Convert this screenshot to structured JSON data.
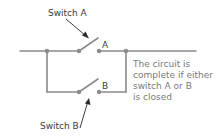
{
  "diagram": {
    "type": "parallel-switch-circuit",
    "labels": {
      "switch_a_callout": "Switch A",
      "switch_b_callout": "Switch B",
      "contact_a": "A",
      "contact_b": "B"
    },
    "note": {
      "lines": [
        "The circuit is",
        "complete if either",
        "switch A or B",
        "is closed"
      ]
    },
    "colors": {
      "wire": "#8a8a8a",
      "node": "#8a8a8a",
      "label_text": "#3a3a3a",
      "note_text": "#7a7a7a"
    }
  }
}
